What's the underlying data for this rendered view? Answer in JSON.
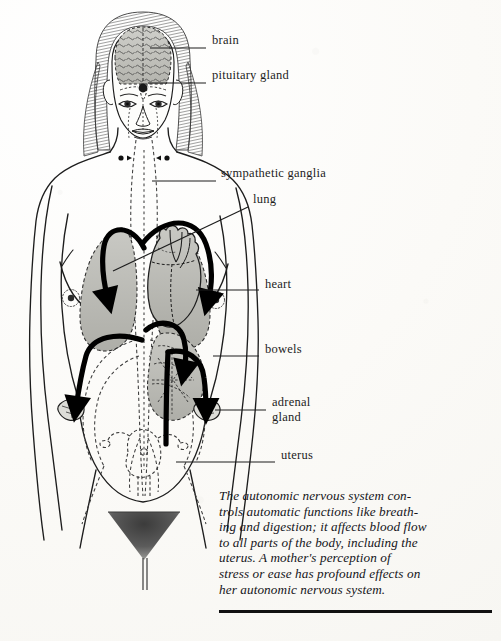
{
  "figure": {
    "background_color": "#fbfaf7",
    "ink_color": "#1d1d1d",
    "organ_shade_color": "#b9b9b4",
    "arrow_color": "#000000"
  },
  "labels": [
    {
      "id": "brain",
      "text": "brain",
      "x": 212,
      "y": 41,
      "leader_from_x": 150,
      "leader_from_y": 48,
      "leader_to_x": 206,
      "leader_to_y": 48
    },
    {
      "id": "pituitary-gland",
      "text": "pituitary gland",
      "x": 212,
      "y": 76,
      "leader_from_x": 148,
      "leader_from_y": 83,
      "leader_to_x": 206,
      "leader_to_y": 83
    },
    {
      "id": "sympathetic-ganglia",
      "text": "sympathetic ganglia",
      "x": 221,
      "y": 173,
      "leader_from_x": 152,
      "leader_from_y": 181,
      "leader_to_x": 216,
      "leader_to_y": 181
    },
    {
      "id": "lung",
      "text": "lung",
      "x": 253,
      "y": 199,
      "leader_from_x": 113,
      "leader_from_y": 271,
      "leader_to_x": 248,
      "leader_to_y": 207
    },
    {
      "id": "heart",
      "text": "heart",
      "x": 265,
      "y": 284,
      "leader_from_x": 196,
      "leader_from_y": 290,
      "leader_to_x": 259,
      "leader_to_y": 290
    },
    {
      "id": "bowels",
      "text": "bowels",
      "x": 265,
      "y": 349,
      "leader_from_x": 213,
      "leader_from_y": 356,
      "leader_to_x": 259,
      "leader_to_y": 356
    },
    {
      "id": "adrenal-gland",
      "text": "adrenal",
      "text2": "gland",
      "x": 272,
      "y": 398,
      "leader_from_x": 215,
      "leader_from_y": 410,
      "leader_to_x": 266,
      "leader_to_y": 410
    },
    {
      "id": "uterus",
      "text": "uterus",
      "x": 281,
      "y": 455,
      "leader_from_x": 176,
      "leader_from_y": 462,
      "leader_to_x": 275,
      "leader_to_y": 462
    }
  ],
  "caption": {
    "lines": [
      "The autonomic nervous system con-",
      "trols automatic functions like breath-",
      "ing and digestion; it affects blood flow",
      "to all parts of the body, including the",
      "uterus. A mother's perception of",
      "stress or ease has profound effects on",
      "her autonomic nervous system."
    ]
  },
  "organs": {
    "shaded": [
      "brain",
      "left-lung",
      "right-lung",
      "heart",
      "bowels"
    ],
    "arrow_count": 6,
    "nerve_paths": "dashed"
  }
}
